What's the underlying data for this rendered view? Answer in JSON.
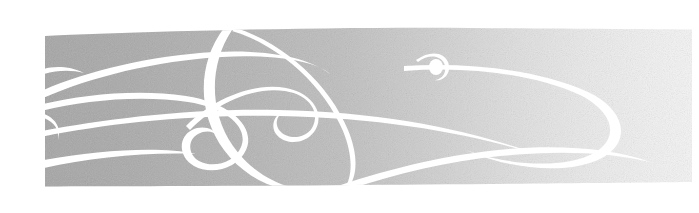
{
  "image": {
    "kind": "decorative-banner",
    "title": "Decorative swirl flourish banner",
    "width": 699,
    "height": 213,
    "page_background": "#ffffff",
    "has_text": false,
    "description": "Horizontal grainy gray band with white calligraphic swirl flourishes"
  },
  "band": {
    "name": "textured-gray-band",
    "left": 44,
    "right": 692,
    "top": 30,
    "bottom": 186,
    "top_left_y": 36,
    "top_right_y": 29,
    "bottom_left_y": 186,
    "bottom_right_y": 182,
    "fill_left_color": "#a9a9a9",
    "fill_mid_color": "#c2c2c2",
    "fill_right_color": "#f2f2f2",
    "texture": "stochastic-dither-grain",
    "texture_opacity": 0.5
  },
  "flourish": {
    "name": "white-swirl-ornament",
    "stroke_color": "#ffffff",
    "stroke_count": 9,
    "accent_dot": {
      "name": "teardrop-dot",
      "cx": 436,
      "cy": 67,
      "rx": 7,
      "ry": 8
    }
  }
}
